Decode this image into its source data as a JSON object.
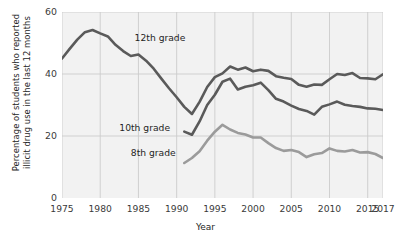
{
  "chart_data": {
    "type": "line",
    "title": "",
    "xlabel": "Year",
    "ylabel": "Percentage of students who reported illicit drug use in the last 12 months",
    "ylabel_line1": "Percentage of students who reported",
    "ylabel_line2": "illicit drug use in the last 12 months",
    "xlim": [
      1975,
      2017
    ],
    "ylim": [
      0,
      60
    ],
    "yticks": [
      0,
      20,
      40,
      60
    ],
    "ytick_labels": [
      "0",
      "20",
      "40",
      "60"
    ],
    "xticks": [
      1975,
      1980,
      1985,
      1990,
      1995,
      2000,
      2005,
      2010,
      2015,
      2017
    ],
    "xtick_labels": [
      "1975",
      "1980",
      "1985",
      "1990",
      "1995",
      "2000",
      "2005",
      "2010",
      "2015",
      "2017"
    ],
    "grid": true,
    "legend": "inline-labels",
    "plot_background": "#f2f2f2",
    "grid_color": "#cccccc",
    "series": [
      {
        "name": "12th grade",
        "color": "#5a5a5a",
        "label_text": "12th grade",
        "x": [
          1975,
          1976,
          1977,
          1978,
          1979,
          1980,
          1981,
          1982,
          1983,
          1984,
          1985,
          1986,
          1987,
          1988,
          1989,
          1990,
          1991,
          1992,
          1993,
          1994,
          1995,
          1996,
          1997,
          1998,
          1999,
          2000,
          2001,
          2002,
          2003,
          2004,
          2005,
          2006,
          2007,
          2008,
          2009,
          2010,
          2011,
          2012,
          2013,
          2014,
          2015,
          2016,
          2017
        ],
        "values": [
          45.0,
          48.1,
          51.1,
          53.5,
          54.2,
          53.1,
          52.1,
          49.4,
          47.4,
          45.8,
          46.3,
          44.3,
          41.7,
          38.5,
          35.4,
          32.5,
          29.4,
          27.1,
          31.0,
          35.8,
          39.0,
          40.2,
          42.4,
          41.4,
          42.1,
          40.9,
          41.4,
          41.0,
          39.3,
          38.8,
          38.4,
          36.5,
          35.9,
          36.6,
          36.5,
          38.3,
          40.0,
          39.7,
          40.3,
          38.7,
          38.6,
          38.3,
          39.9
        ]
      },
      {
        "name": "10th grade",
        "color": "#5a5a5a",
        "label_text": "10th grade",
        "x": [
          1991,
          1992,
          1993,
          1994,
          1995,
          1996,
          1997,
          1998,
          1999,
          2000,
          2001,
          2002,
          2003,
          2004,
          2005,
          2006,
          2007,
          2008,
          2009,
          2010,
          2011,
          2012,
          2013,
          2014,
          2015,
          2016,
          2017
        ],
        "values": [
          21.4,
          20.4,
          24.7,
          30.0,
          33.3,
          37.5,
          38.5,
          35.0,
          35.9,
          36.4,
          37.2,
          34.8,
          32.0,
          31.1,
          29.8,
          28.7,
          28.1,
          26.9,
          29.4,
          30.2,
          31.1,
          30.1,
          29.7,
          29.4,
          28.9,
          28.8,
          28.4
        ]
      },
      {
        "name": "8th grade",
        "color": "#9b9b9b",
        "label_text": "8th grade",
        "x": [
          1991,
          1992,
          1993,
          1994,
          1995,
          1996,
          1997,
          1998,
          1999,
          2000,
          2001,
          2002,
          2003,
          2004,
          2005,
          2006,
          2007,
          2008,
          2009,
          2010,
          2011,
          2012,
          2013,
          2014,
          2015,
          2016,
          2017
        ],
        "values": [
          11.3,
          12.9,
          15.1,
          18.5,
          21.4,
          23.6,
          22.1,
          21.0,
          20.5,
          19.5,
          19.5,
          17.7,
          16.1,
          15.2,
          15.5,
          14.8,
          13.2,
          14.1,
          14.5,
          16.0,
          15.2,
          15.0,
          15.5,
          14.7,
          14.8,
          14.2,
          12.9
        ]
      }
    ],
    "annotations": [
      {
        "text": "12th grade",
        "x": 1984.5,
        "y": 51.5
      },
      {
        "text": "10th grade",
        "x": 1982.5,
        "y": 22.5
      },
      {
        "text": "8th grade",
        "x": 1984.0,
        "y": 14.5
      }
    ]
  }
}
